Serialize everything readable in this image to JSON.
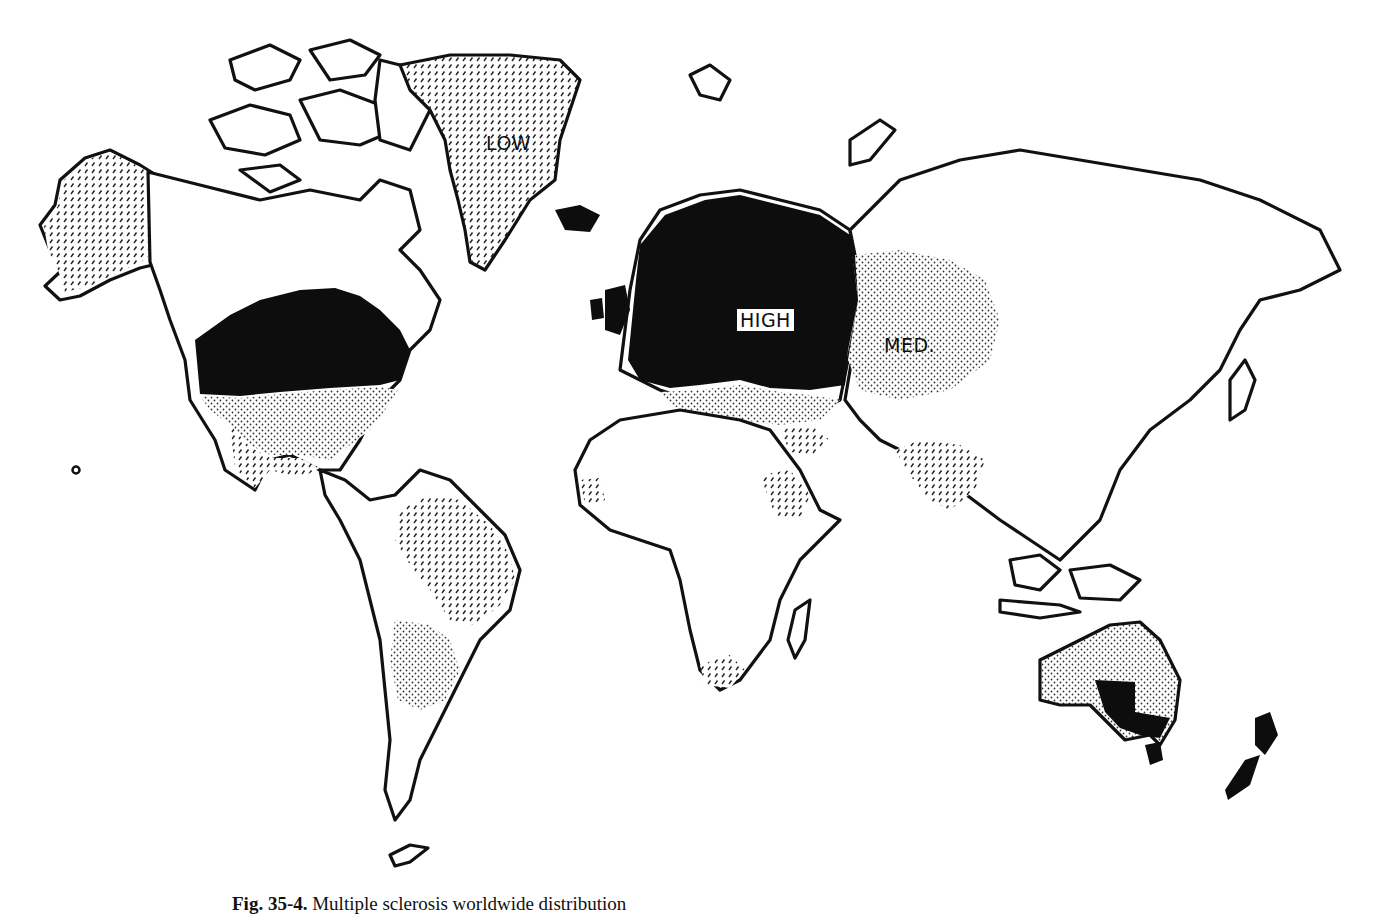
{
  "figure": {
    "caption_label": "Fig. 35-4.",
    "caption_text": "Multiple sclerosis worldwide distribution"
  },
  "map": {
    "labels": {
      "low": "LOW",
      "high": "HIGH",
      "med": "MED."
    },
    "risk_zones": [
      {
        "level": "high",
        "fill": "solid black",
        "regions": [
          "Northern United States",
          "Southern Canada",
          "Northern & Central Europe",
          "British Isles",
          "Southeastern Australia",
          "Tasmania",
          "New Zealand"
        ]
      },
      {
        "level": "medium",
        "fill": "fine dots",
        "regions": [
          "Southern United States",
          "Russia / Western Siberia",
          "Southern Europe",
          "Most of Australia",
          "Southern South America"
        ]
      },
      {
        "level": "low",
        "fill": "diagonal hatching",
        "regions": [
          "Greenland",
          "Alaska",
          "Mexico",
          "Northern South America",
          "India",
          "Middle East",
          "East Africa",
          "West Africa coast",
          "South Africa"
        ]
      }
    ],
    "colors": {
      "high": "#0d0d0d",
      "outline": "#111111",
      "background": "#ffffff"
    }
  }
}
